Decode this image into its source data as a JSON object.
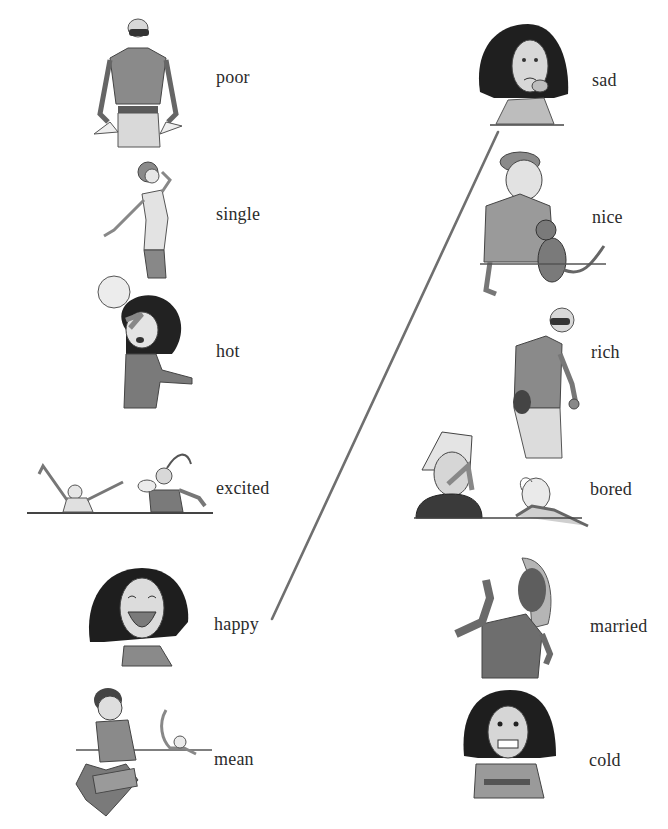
{
  "worksheet": {
    "left_column": [
      {
        "word": "poor",
        "icon": "man-empty-pockets-icon"
      },
      {
        "word": "single",
        "icon": "woman-on-phone-icon"
      },
      {
        "word": "hot",
        "icon": "woman-sun-sweating-icon"
      },
      {
        "word": "excited",
        "icon": "two-kids-cheering-icon"
      },
      {
        "word": "happy",
        "icon": "woman-laughing-icon"
      },
      {
        "word": "mean",
        "icon": "boy-smashing-box-icon"
      }
    ],
    "right_column": [
      {
        "word": "sad",
        "icon": "girl-crying-icon"
      },
      {
        "word": "nice",
        "icon": "boy-petting-cat-icon"
      },
      {
        "word": "rich",
        "icon": "man-wallet-keys-icon"
      },
      {
        "word": "bored",
        "icon": "two-kids-yawning-icon"
      },
      {
        "word": "married",
        "icon": "woman-showing-ring-icon"
      },
      {
        "word": "cold",
        "icon": "girl-shivering-icon"
      }
    ],
    "connections": [
      {
        "from": "happy",
        "to": "sad",
        "x1": 272,
        "y1": 619,
        "x2": 498,
        "y2": 132,
        "color": "#6f6f6f"
      }
    ]
  }
}
